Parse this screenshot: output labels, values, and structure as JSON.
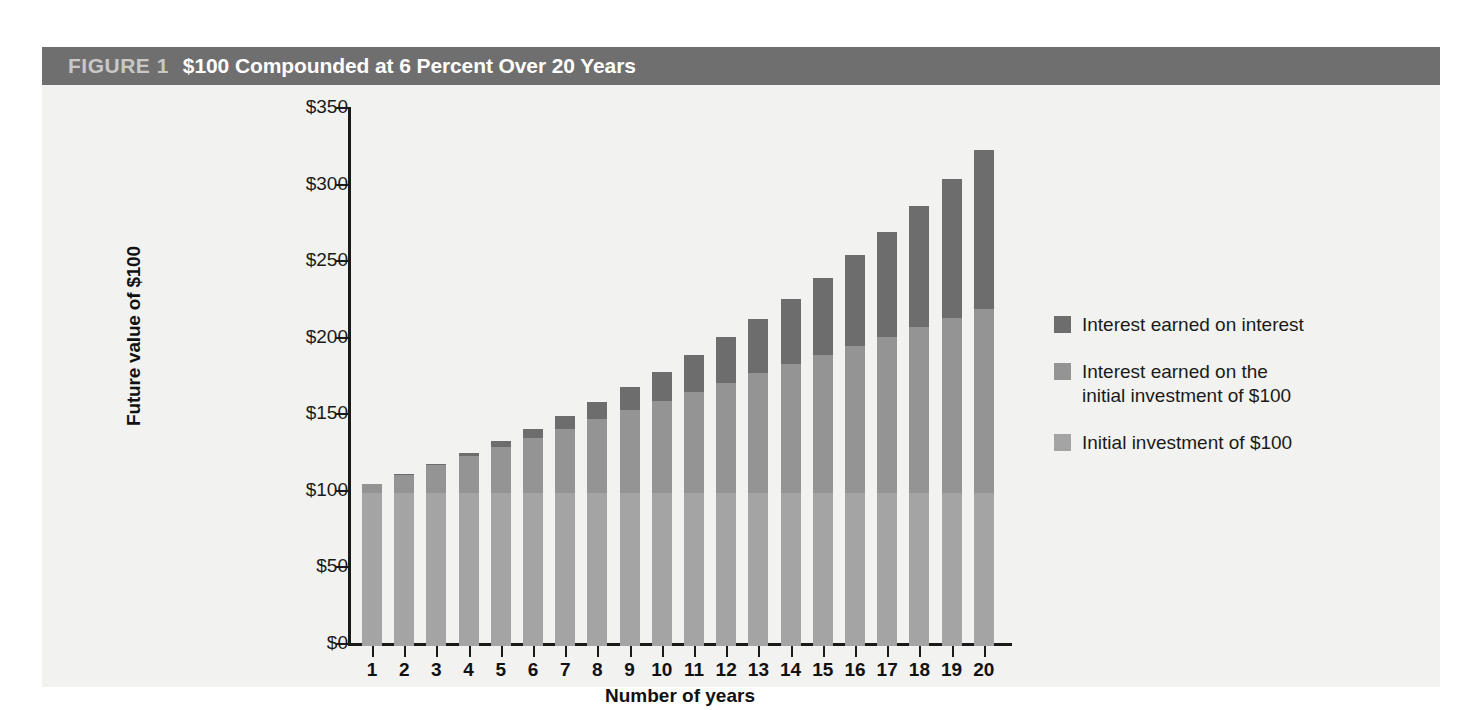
{
  "figure": {
    "number": "FIGURE 1",
    "title": "$100 Compounded at 6 Percent Over 20 Years",
    "header_bg": "#706f6f",
    "panel_bg": "#f2f2f0"
  },
  "legend": {
    "items": [
      {
        "label": "Interest earned on interest",
        "color": "#6d6d6d",
        "key": "compound"
      },
      {
        "label": "Interest earned on the\ninitial investment of $100",
        "color": "#949494",
        "key": "simple"
      },
      {
        "label": "Initial investment of $100",
        "color": "#a4a4a4",
        "key": "principal"
      }
    ]
  },
  "chart_data": {
    "type": "bar",
    "stacked": true,
    "title": "$100 Compounded at 6 Percent Over 20 Years",
    "xlabel": "Number of years",
    "ylabel": "Future value of $100",
    "ylim": [
      0,
      350
    ],
    "ytick_labels": [
      "$0",
      "$50",
      "$100",
      "$150",
      "$200",
      "$250",
      "$300",
      "$350"
    ],
    "ytick_values": [
      0,
      50,
      100,
      150,
      200,
      250,
      300,
      350
    ],
    "ytick_step": 50,
    "grid": false,
    "legend_position": "right",
    "categories": [
      1,
      2,
      3,
      4,
      5,
      6,
      7,
      8,
      9,
      10,
      11,
      12,
      13,
      14,
      15,
      16,
      17,
      18,
      19,
      20
    ],
    "xtick_labels": [
      "1",
      "2",
      "3",
      "4",
      "5",
      "6",
      "7",
      "8",
      "9",
      "10",
      "11",
      "12",
      "13",
      "14",
      "15",
      "16",
      "17",
      "18",
      "19",
      "20"
    ],
    "series": [
      {
        "name": "Initial investment of $100",
        "color": "#a4a4a4",
        "values": [
          100,
          100,
          100,
          100,
          100,
          100,
          100,
          100,
          100,
          100,
          100,
          100,
          100,
          100,
          100,
          100,
          100,
          100,
          100,
          100
        ]
      },
      {
        "name": "Interest earned on the initial investment of $100",
        "color": "#949494",
        "values": [
          6,
          12,
          18,
          24,
          30,
          36,
          42,
          48,
          54,
          60,
          66,
          72,
          78,
          84,
          90,
          96,
          102,
          108,
          114,
          120
        ]
      },
      {
        "name": "Interest earned on interest",
        "color": "#6d6d6d",
        "values": [
          0.0,
          0.4,
          1.1,
          2.2,
          3.8,
          5.9,
          8.4,
          11.4,
          15.0,
          19.2,
          24.0,
          29.5,
          35.7,
          42.6,
          50.4,
          59.1,
          68.6,
          79.2,
          90.8,
          103.6
        ]
      }
    ],
    "totals": [
      106.0,
      112.4,
      119.1,
      126.2,
      133.8,
      141.9,
      150.4,
      159.4,
      169.0,
      179.2,
      190.0,
      201.5,
      213.7,
      226.6,
      240.4,
      255.1,
      270.6,
      287.2,
      304.8,
      323.6
    ]
  }
}
